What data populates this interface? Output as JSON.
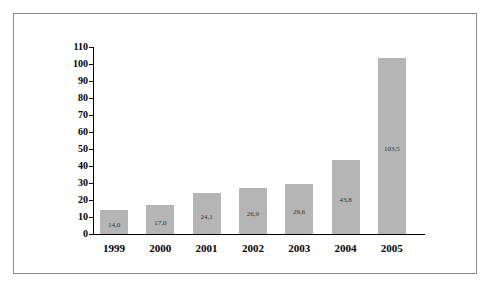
{
  "chart_data": {
    "type": "bar",
    "title": "",
    "xlabel": "",
    "ylabel": "",
    "categories": [
      "1999",
      "2000",
      "2001",
      "2002",
      "2003",
      "2004",
      "2005"
    ],
    "values": [
      14.0,
      17.0,
      24.1,
      26.9,
      29.6,
      43.8,
      103.5
    ],
    "value_labels": [
      "14,0",
      "17,0",
      "24,1",
      "26,9",
      "29,6",
      "43,8",
      "103,5"
    ],
    "ylim": [
      0,
      110
    ],
    "yticks": [
      0,
      10,
      20,
      30,
      40,
      50,
      60,
      70,
      80,
      90,
      100,
      110
    ],
    "grid": false,
    "legend": null,
    "bar_color": "#b5b5b5"
  }
}
